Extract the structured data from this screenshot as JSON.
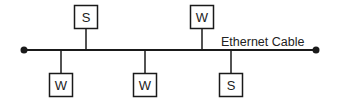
{
  "diagram": {
    "type": "bus-network-topology",
    "colors": {
      "stroke": "#1a1a1a",
      "text": "#222222",
      "background": "#ffffff"
    },
    "cable": {
      "label": "Ethernet Cable",
      "x1": 24,
      "x2": 316,
      "y": 50
    },
    "nodes": [
      {
        "id": "s1",
        "label": "S",
        "side": "top",
        "x": 74,
        "y": 5,
        "stemX": 86
      },
      {
        "id": "w1",
        "label": "W",
        "side": "bottom",
        "x": 49,
        "y": 73,
        "stemX": 61
      },
      {
        "id": "w2",
        "label": "W",
        "side": "bottom",
        "x": 133,
        "y": 73,
        "stemX": 145
      },
      {
        "id": "w3",
        "label": "W",
        "side": "top",
        "x": 190,
        "y": 5,
        "stemX": 202
      },
      {
        "id": "s2",
        "label": "S",
        "side": "bottom",
        "x": 219,
        "y": 73,
        "stemX": 231
      }
    ],
    "legend": {
      "S": "Server",
      "W": "Workstation"
    }
  }
}
